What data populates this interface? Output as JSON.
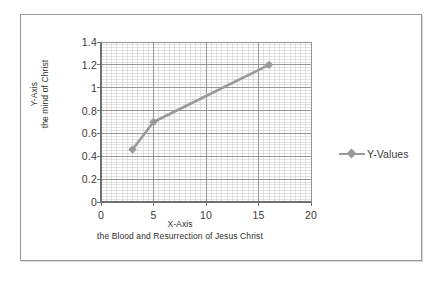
{
  "chart_data": {
    "type": "line",
    "title": "",
    "subtitle": "",
    "xlabel": "X-Axis",
    "xlabel_line2": "the Blood and Resurrection of Jesus Christ",
    "ylabel": "Y-Axis",
    "ylabel_line2": "the mind of Christ",
    "xlim": [
      0,
      20
    ],
    "ylim": [
      0,
      1.4
    ],
    "x_ticks": [
      0,
      5,
      10,
      15,
      20
    ],
    "x_tick_labels": [
      "0",
      "5",
      "10",
      "15",
      "20"
    ],
    "y_ticks": [
      0,
      0.2,
      0.4,
      0.6,
      0.8,
      1,
      1.2,
      1.4
    ],
    "y_tick_labels": [
      "0",
      "0.2",
      "0.4",
      "0.6",
      "0.8",
      "1",
      "1.2",
      "1.4"
    ],
    "grid": true,
    "minor_grid": true,
    "minor_grid_x_step": 0.5,
    "minor_grid_y_step": 0.025,
    "legend_position": "right",
    "series": [
      {
        "name": "Y-Values",
        "marker": "diamond",
        "color": "#9a9a9a",
        "x": [
          3,
          5,
          16
        ],
        "values": [
          0.46,
          0.7,
          1.2
        ]
      }
    ]
  },
  "legend": {
    "entries": [
      {
        "label": "Y-Values"
      }
    ]
  },
  "axes": {
    "y_title_line1": "Y-Axis",
    "y_title_line2": "the mind of Christ",
    "x_title_line1": "X-Axis",
    "x_title_line2": "the Blood and Resurrection of Jesus Christ"
  },
  "colors": {
    "series": "#9a9a9a",
    "grid_major": "#8f8f8f",
    "grid_minor": "#cfcfcf",
    "axis": "#808080",
    "text": "#3a3a3a",
    "frame": "#9a9a9a",
    "background": "#ffffff"
  }
}
